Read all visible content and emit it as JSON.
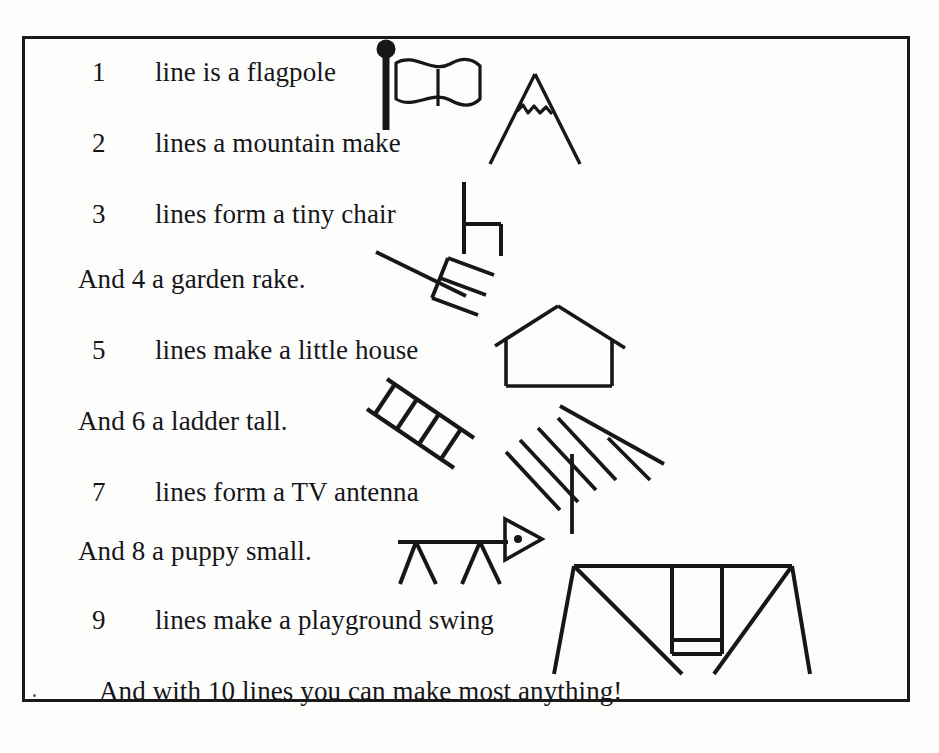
{
  "document": {
    "kind": "illustrated-poem-page",
    "title": "Lines poem",
    "border_color": "#1a1a1a",
    "text_color": "#16161a",
    "background_color": "#fdfdfc"
  },
  "poem": {
    "lines": [
      {
        "number": "1",
        "text": "line is a flagpole",
        "indent": "numbered"
      },
      {
        "number": "2",
        "text": "lines a mountain make",
        "indent": "numbered"
      },
      {
        "number": "3",
        "text": "lines form a tiny chair",
        "indent": "numbered"
      },
      {
        "number": "",
        "text": "And 4 a garden rake.",
        "indent": "plain"
      },
      {
        "number": "5",
        "text": "lines make a little house",
        "indent": "numbered"
      },
      {
        "number": "",
        "text": "And 6 a ladder tall.",
        "indent": "plain"
      },
      {
        "number": "7",
        "text": "lines form a TV antenna",
        "indent": "numbered"
      },
      {
        "number": "",
        "text": "And 8 a puppy small.",
        "indent": "plain"
      },
      {
        "number": "9",
        "text": "lines make a playground swing",
        "indent": "numbered"
      },
      {
        "number": "",
        "text": "And with 10 lines you can make most anything!",
        "indent": "final"
      }
    ]
  },
  "illustrations": [
    {
      "name": "flagpole",
      "line_count": "1",
      "caption": "flag on a pole with round finial"
    },
    {
      "name": "mountain",
      "line_count": "2",
      "caption": "peak with snow cap zigzag"
    },
    {
      "name": "chair",
      "line_count": "3",
      "caption": "tiny chair in profile"
    },
    {
      "name": "garden-rake",
      "line_count": "4",
      "caption": "rake with handle, head bar and tines"
    },
    {
      "name": "house",
      "line_count": "5",
      "caption": "little house with gable roof"
    },
    {
      "name": "ladder",
      "line_count": "6",
      "caption": "leaning ladder with rungs"
    },
    {
      "name": "tv-antenna",
      "line_count": "7",
      "caption": "roof TV antenna with mast and elements"
    },
    {
      "name": "puppy",
      "line_count": "8",
      "caption": "stick puppy with triangular head"
    },
    {
      "name": "swing",
      "line_count": "9",
      "caption": "playground swing set with A-frame"
    }
  ]
}
